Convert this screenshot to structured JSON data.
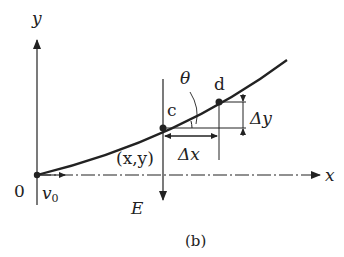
{
  "diagram": {
    "caption": "(b)",
    "axes": {
      "x_label": "x",
      "y_label": "y",
      "origin_label": "0"
    },
    "initial_velocity_label": "v",
    "initial_velocity_subscript": "0",
    "field_label": "E",
    "point_c_label": "c",
    "point_d_label": "d",
    "point_c_coords": "(x,y)",
    "angle_label": "θ",
    "delta_x_label": "Δx",
    "delta_y_label": "Δy",
    "colors": {
      "stroke": "#222222",
      "background": "#ffffff"
    }
  }
}
